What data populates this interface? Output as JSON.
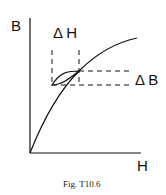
{
  "figure": {
    "y_axis_label": "B",
    "x_axis_label": "H",
    "delta_h_label": "Δ H",
    "delta_b_label": "Δ B",
    "caption": "Fig.   T10.6"
  },
  "colors": {
    "line": "#111111",
    "background": "#ffffff"
  }
}
